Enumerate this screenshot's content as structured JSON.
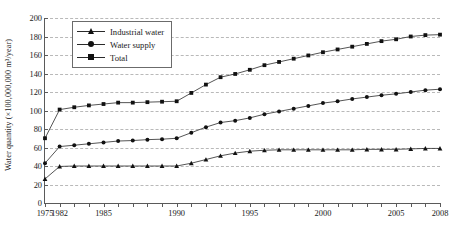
{
  "chart_data": {
    "type": "line",
    "title": "",
    "xlabel": "",
    "ylabel": "Water quantity (×100,000,000 m³/year)",
    "ylim": [
      0,
      200
    ],
    "ytick_values": [
      0,
      20,
      40,
      60,
      80,
      100,
      120,
      140,
      160,
      180,
      200
    ],
    "ytick_labels": [
      "0",
      "20",
      "40",
      "60",
      "80",
      "100",
      "120",
      "140",
      "160",
      "180",
      "200"
    ],
    "grid": true,
    "legend_position": "upper left inside",
    "x": [
      1975,
      1982,
      1983,
      1984,
      1985,
      1986,
      1987,
      1988,
      1989,
      1990,
      1991,
      1992,
      1993,
      1994,
      1995,
      1996,
      1997,
      1998,
      1999,
      2000,
      2001,
      2002,
      2003,
      2004,
      2005,
      2006,
      2007,
      2008
    ],
    "xtick_labels": [
      "1975",
      "1982",
      "1985",
      "1990",
      "1995",
      "2000",
      "2005",
      "2008"
    ],
    "xtick_positions": [
      1975,
      1982,
      1985,
      1990,
      1995,
      2000,
      2005,
      2008
    ],
    "series": [
      {
        "name": "Industrial water",
        "marker": "triangle",
        "values": [
          26,
          39.5,
          40,
          40,
          40,
          40,
          40,
          40,
          40,
          40,
          43,
          47,
          51,
          54,
          56,
          57,
          57.5,
          57.5,
          57.5,
          57.5,
          57.5,
          57.5,
          58,
          58,
          58,
          58.5,
          59,
          59
        ]
      },
      {
        "name": "Water supply",
        "marker": "circle",
        "values": [
          43,
          61,
          62.5,
          64,
          65.5,
          67,
          67.5,
          68.5,
          69,
          70,
          76,
          82,
          87,
          89,
          92,
          96,
          99,
          102,
          105,
          108,
          110,
          112.5,
          114.5,
          116.5,
          118,
          120,
          122,
          123
        ]
      },
      {
        "name": "Total",
        "marker": "square",
        "values": [
          70,
          101,
          103.5,
          105.5,
          107,
          108.5,
          108.5,
          109,
          109.5,
          110,
          119,
          128,
          136,
          139.5,
          144,
          149,
          152.5,
          156,
          159.5,
          163,
          166,
          169,
          172,
          175,
          177,
          180,
          181.5,
          182
        ]
      }
    ]
  },
  "legend": {
    "items": [
      {
        "label": "Industrial water",
        "marker": "tr"
      },
      {
        "label": "Water supply",
        "marker": "ci"
      },
      {
        "label": "Total",
        "marker": "sq"
      }
    ]
  },
  "colors": {
    "line": "#2a2a2a",
    "marker": "#111111",
    "grid": "#b9b9b9",
    "axis": "#5a5a5a"
  }
}
